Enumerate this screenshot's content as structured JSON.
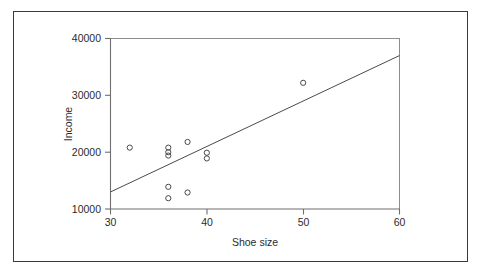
{
  "figure": {
    "background_color": "#ffffff",
    "border_color": "#3a3a3a",
    "marker_color": "#4a4a4a",
    "axis_color": "#6f6f6f"
  },
  "chart_data": {
    "type": "scatter",
    "title": "",
    "xlabel": "Shoe size",
    "ylabel": "Income",
    "xlim": [
      30,
      60
    ],
    "ylim": [
      10000,
      40000
    ],
    "xticks": [
      30,
      40,
      50,
      60
    ],
    "yticks": [
      10000,
      20000,
      30000,
      40000
    ],
    "xtick_labels": [
      "30",
      "40",
      "50",
      "60"
    ],
    "ytick_labels": [
      "10000",
      "20000",
      "30000",
      "40000"
    ],
    "grid": false,
    "legend": "none",
    "marker_style": "open-circle",
    "points": [
      {
        "x": 32,
        "y": 20800
      },
      {
        "x": 36,
        "y": 20800
      },
      {
        "x": 36,
        "y": 20000
      },
      {
        "x": 36,
        "y": 19400
      },
      {
        "x": 38,
        "y": 21800
      },
      {
        "x": 40,
        "y": 19900
      },
      {
        "x": 40,
        "y": 18900
      },
      {
        "x": 36,
        "y": 13900
      },
      {
        "x": 36,
        "y": 11900
      },
      {
        "x": 38,
        "y": 12900
      },
      {
        "x": 50,
        "y": 32200
      }
    ],
    "trend_line": {
      "label": "regression line",
      "x_start": 30,
      "y_start": 13000,
      "x_end": 60,
      "y_end": 37000
    }
  }
}
